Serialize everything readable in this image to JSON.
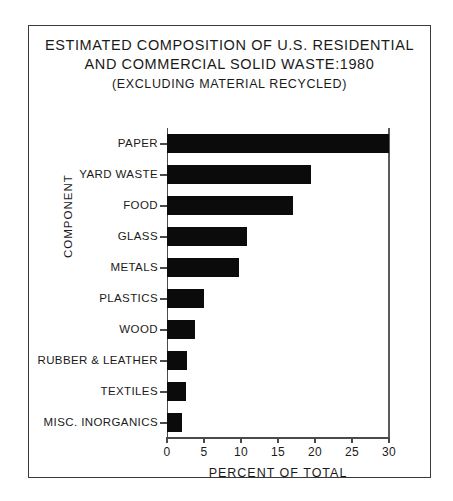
{
  "chart_data": {
    "type": "bar",
    "orientation": "horizontal",
    "title": "ESTIMATED COMPOSITION OF U.S. RESIDENTIAL AND COMMERCIAL SOLID WASTE:1980 (EXCLUDING MATERIAL RECYCLED)",
    "title_lines": [
      "ESTIMATED COMPOSITION OF U.S. RESIDENTIAL",
      "AND COMMERCIAL SOLID WASTE:1980",
      "(EXCLUDING MATERIAL RECYCLED)"
    ],
    "xlabel": "PERCENT OF TOTAL",
    "ylabel": "COMPONENT",
    "categories": [
      "PAPER",
      "YARD WASTE",
      "FOOD",
      "GLASS",
      "METALS",
      "PLASTICS",
      "WOOD",
      "RUBBER & LEATHER",
      "TEXTILES",
      "MISC. INORGANICS"
    ],
    "values": [
      30,
      19.5,
      17,
      10.8,
      9.7,
      5,
      3.8,
      2.7,
      2.6,
      2
    ],
    "xlim": [
      0,
      30
    ],
    "xticks": [
      0,
      5,
      10,
      15,
      20,
      25,
      30
    ],
    "xtick_labels": [
      "0",
      "5",
      "10",
      "15",
      "20",
      "25",
      "30"
    ],
    "grid": false,
    "legend": false,
    "bar_color": "#0b0b0b",
    "axis_color": "#4a4a4a",
    "background_color": "#ffffff"
  }
}
